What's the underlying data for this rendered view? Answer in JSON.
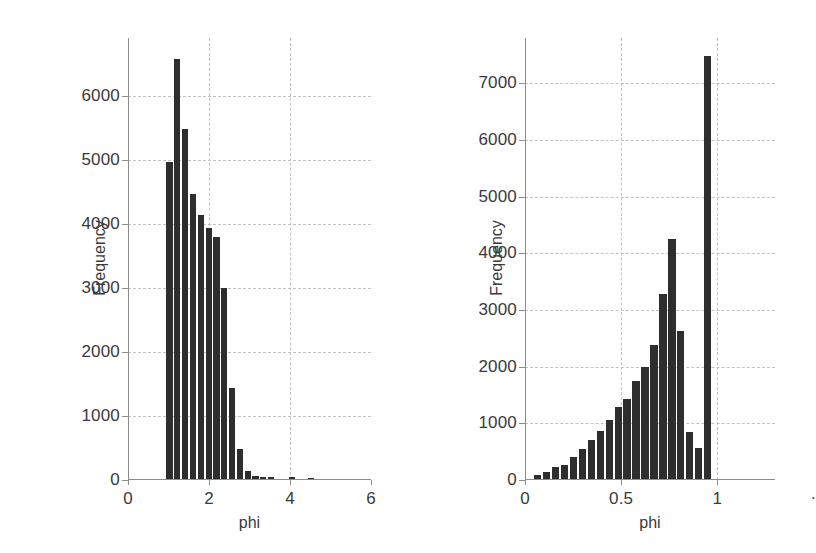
{
  "figure": {
    "background": "#ffffff",
    "bar_color": "#2e2e2e",
    "grid_color": "#b9b9b9",
    "axis_color": "#8d8d8d"
  },
  "chart_data": [
    {
      "type": "bar",
      "panel": "left",
      "title": "",
      "xlabel": "phi",
      "ylabel": "Frequency",
      "xlim": [
        0,
        6
      ],
      "ylim": [
        0,
        6900
      ],
      "xticks": [
        0,
        2,
        4,
        6
      ],
      "xticklabels": [
        "0",
        "2",
        "4",
        "6"
      ],
      "yticks": [
        0,
        1000,
        2000,
        3000,
        4000,
        5000,
        6000
      ],
      "yticklabels": [
        "0",
        "1000",
        "2000",
        "3000",
        "4000",
        "5000",
        "6000"
      ],
      "grid": true,
      "legend": "none",
      "bin_width": 0.193,
      "bin_left_edges": [
        0.95,
        1.143,
        1.336,
        1.529,
        1.722,
        1.915,
        2.108,
        2.301,
        2.494,
        2.687,
        2.88,
        3.073,
        3.266,
        3.459,
        3.98,
        4.45
      ],
      "values": [
        4970,
        6570,
        5480,
        4460,
        4130,
        3940,
        3800,
        2990,
        1430,
        490,
        140,
        55,
        50,
        45,
        40,
        35
      ]
    },
    {
      "type": "bar",
      "panel": "right",
      "title": "",
      "xlabel": "phi",
      "ylabel": "Frequency",
      "xlim": [
        0,
        1.3
      ],
      "ylim": [
        0,
        7800
      ],
      "xticks": [
        0,
        0.5,
        1
      ],
      "xticklabels": [
        "0",
        "0.5",
        "1"
      ],
      "yticks": [
        0,
        1000,
        2000,
        3000,
        4000,
        5000,
        6000,
        7000
      ],
      "yticklabels": [
        "0",
        "1000",
        "2000",
        "3000",
        "4000",
        "5000",
        "6000",
        "7000"
      ],
      "grid": true,
      "legend": "none",
      "bin_width": 0.0465,
      "bin_left_edges": [
        0.047,
        0.0935,
        0.14,
        0.1865,
        0.233,
        0.2795,
        0.326,
        0.3725,
        0.419,
        0.4655,
        0.512,
        0.5585,
        0.605,
        0.6515,
        0.698,
        0.7445,
        0.791,
        0.8375,
        0.884,
        0.9305,
        0.977,
        1.0235
      ],
      "values": [
        80,
        140,
        230,
        260,
        400,
        550,
        700,
        870,
        1060,
        1290,
        1430,
        1750,
        1990,
        2380,
        3290,
        4250,
        2630,
        840,
        570,
        7480,
        0,
        0
      ]
    }
  ]
}
